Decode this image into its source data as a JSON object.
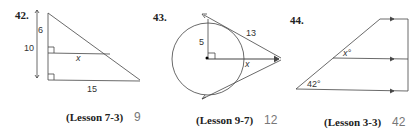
{
  "problems": [
    {
      "number": "42.",
      "labels": {
        "a": "6",
        "b": "10",
        "c": "x",
        "d": "15"
      },
      "lesson": "(Lesson 7-3)",
      "answer": "9"
    },
    {
      "number": "43.",
      "labels": {
        "a": "5",
        "b": "13",
        "c": "x"
      },
      "lesson": "(Lesson 9-7)",
      "answer": "12"
    },
    {
      "number": "44.",
      "labels": {
        "a": "x°",
        "b": "42°"
      },
      "lesson": "(Lesson 3-3)",
      "answer": "42"
    }
  ],
  "colors": {
    "answer": "#777777",
    "text": "#222222"
  }
}
